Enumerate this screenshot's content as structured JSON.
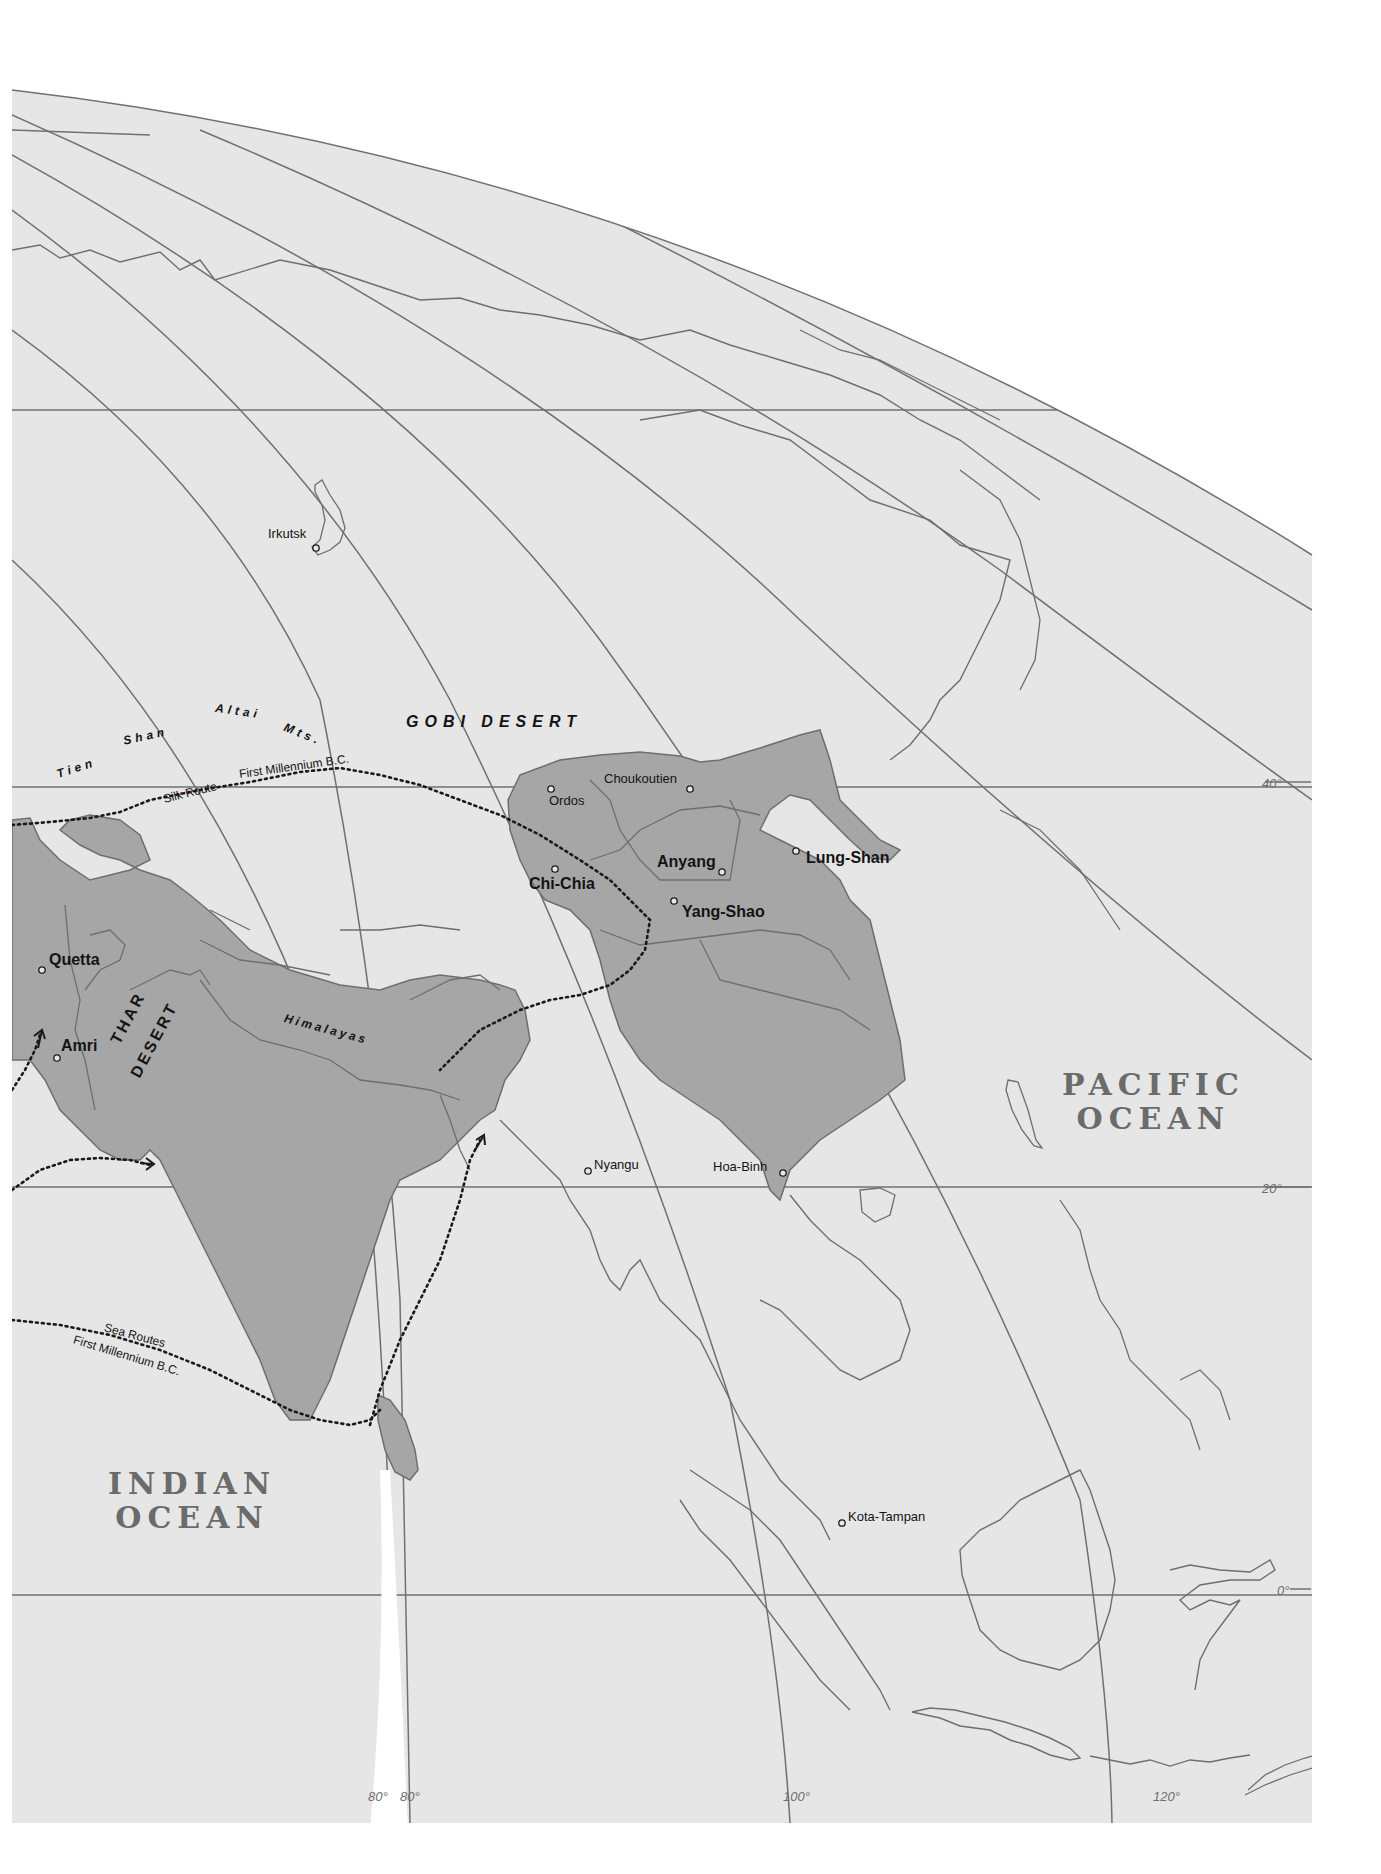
{
  "map": {
    "colors": {
      "paper": "#ffffff",
      "background": "#e6e6e6",
      "land_highlight": "#a6a6a6",
      "coastline": "#6e6e6e",
      "graticule": "#707070",
      "route": "#1a1a1a",
      "ocean_label": "#6b6b6b"
    },
    "oceans": [
      {
        "id": "pacific",
        "line1": "PACIFIC",
        "line2": "OCEAN"
      },
      {
        "id": "indian",
        "line1": "INDIAN",
        "line2": "OCEAN"
      }
    ],
    "physical_features": {
      "gobi": "GOBI DESERT",
      "thar_1": "THAR",
      "thar_2": "DESERT",
      "himalayas": "Himalayas",
      "tien": "Tien",
      "shan": "Shan",
      "altai": "Altai",
      "mts": "Mts."
    },
    "sites": [
      {
        "name": "Irkutsk",
        "style": "small"
      },
      {
        "name": "Choukoutien",
        "style": "small"
      },
      {
        "name": "Ordos",
        "style": "small"
      },
      {
        "name": "Chi-Chia",
        "style": "large"
      },
      {
        "name": "Anyang",
        "style": "large"
      },
      {
        "name": "Lung-Shan",
        "style": "large"
      },
      {
        "name": "Yang-Shao",
        "style": "large"
      },
      {
        "name": "Quetta",
        "style": "large"
      },
      {
        "name": "Amri",
        "style": "large"
      },
      {
        "name": "Nyangu",
        "style": "small"
      },
      {
        "name": "Hoa-Binh",
        "style": "small"
      },
      {
        "name": "Kota-Tampan",
        "style": "small"
      }
    ],
    "routes": {
      "silk_1": "Silk Route",
      "silk_2": "First Millennium B.C.",
      "sea_1": "Sea Routes",
      "sea_2": "First Millennium B.C."
    },
    "graticule": {
      "latitudes": [
        "40°",
        "20°",
        "0°"
      ],
      "longitudes": [
        "80°",
        "80°",
        "100°",
        "120°"
      ]
    }
  }
}
